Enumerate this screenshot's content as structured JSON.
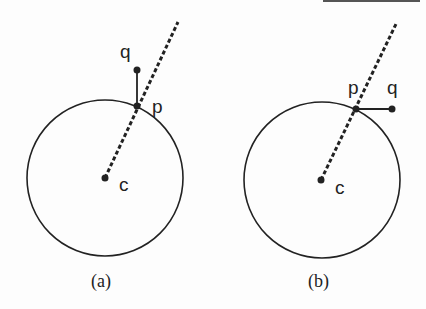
{
  "panels": [
    {
      "caption": "(a)",
      "labels": {
        "q": "q",
        "p": "p",
        "c": "c"
      }
    },
    {
      "caption": "(b)",
      "labels": {
        "q": "q",
        "p": "p",
        "c": "c"
      }
    }
  ],
  "colors": {
    "stroke": "#222222",
    "background": "#fdfdfd"
  }
}
